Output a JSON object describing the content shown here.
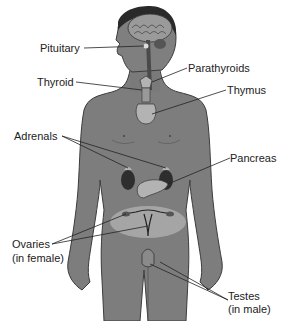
{
  "diagram": {
    "labels": {
      "pituitary": "Pituitary",
      "parathyroids": "Parathyroids",
      "thyroid": "Thyroid",
      "thymus": "Thymus",
      "adrenals": "Adrenals",
      "pancreas": "Pancreas",
      "ovaries_line1": "Ovaries",
      "ovaries_line2": "(in female)",
      "testes_line1": "Testes",
      "testes_line2": "(in male)"
    },
    "colors": {
      "body": "#7d7d7d",
      "body_outline": "#3c3c3c",
      "organ_light": "#b3b3b3",
      "organ_dark": "#2e2e2e",
      "pelvis_highlight": "#a5a5a5",
      "hair": "#2a2a2a",
      "leader_line": "#222222",
      "text": "#222222"
    }
  }
}
